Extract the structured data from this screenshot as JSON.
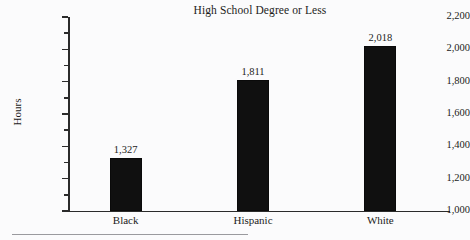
{
  "chart_data": {
    "type": "bar",
    "title": "High School Degree or Less",
    "xlabel": "",
    "ylabel": "Hours",
    "categories": [
      "Black",
      "Hispanic",
      "White"
    ],
    "values": [
      1327,
      1811,
      2018
    ],
    "value_labels": [
      "1,327",
      "1,811",
      "2,018"
    ],
    "ylim": [
      1000,
      2200
    ],
    "y_major_step": 200,
    "y_minor_step": 100,
    "y_tick_labels": [
      "1,000",
      "1,200",
      "1,400",
      "1,600",
      "1,800",
      "2,000",
      "2,200"
    ],
    "y_tick_values": [
      1000,
      1200,
      1400,
      1600,
      1800,
      2000,
      2200
    ],
    "grid": false,
    "legend": null,
    "bar_color": "#101010",
    "axis_color": "#2b2b2b",
    "background_color": "#fbfbfc"
  },
  "axis": {
    "y_label": "Hours",
    "ticks": [
      {
        "label": "2,200",
        "value": 2200
      },
      {
        "label": "2,000",
        "value": 2000
      },
      {
        "label": "1,800",
        "value": 1800
      },
      {
        "label": "1,600",
        "value": 1600
      },
      {
        "label": "1,400",
        "value": 1400
      },
      {
        "label": "1,200",
        "value": 1200
      },
      {
        "label": "1,000",
        "value": 1000
      }
    ]
  },
  "bars": [
    {
      "category": "Black",
      "value": 1327,
      "value_label": "1,327"
    },
    {
      "category": "Hispanic",
      "value": 1811,
      "value_label": "1,811"
    },
    {
      "category": "White",
      "value": 2018,
      "value_label": "2,018"
    }
  ],
  "title": "High School Degree or Less"
}
